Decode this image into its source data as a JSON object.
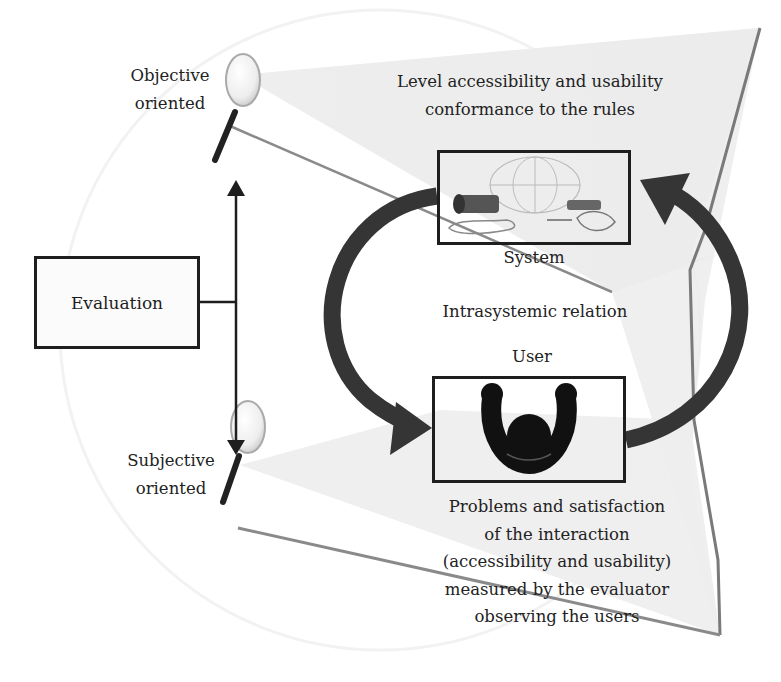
{
  "diagram": {
    "type": "evaluation-concept-diagram",
    "colors": {
      "stroke": "#1e1e1e",
      "arrow": "#333333",
      "cone_fill": "#e9e9e9",
      "background": "#ffffff"
    },
    "left_axis": {
      "top_label_line1": "Objective",
      "top_label_line2": "oriented",
      "bottom_label_line1": "Subjective",
      "bottom_label_line2": "oriented",
      "center_box_label": "Evaluation"
    },
    "top_annotation": {
      "line1": "Level accessibility and usability",
      "line2": "conformance to the rules"
    },
    "system_node": {
      "label": "System",
      "icon": "computer-peripherals-globe-icon"
    },
    "center_label": "Intrasystemic relation",
    "user_node": {
      "label": "User",
      "icon": "person-arms-raised-icon"
    },
    "bottom_annotation": {
      "line1": "Problems and satisfaction",
      "line2": "of the interaction",
      "line3": "(accessibility and usability)",
      "line4": "measured by the evaluator",
      "line5": "observing the users"
    },
    "icons": {
      "top_magnifier": "magnifying-glass-icon",
      "bottom_magnifier": "magnifying-glass-icon",
      "cycle_arrow": "circular-arrow-icon",
      "double_arrow": "vertical-double-arrow-icon"
    }
  }
}
